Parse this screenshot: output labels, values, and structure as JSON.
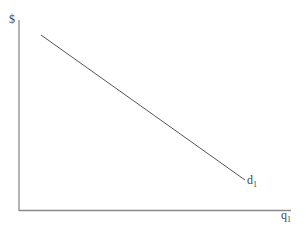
{
  "diagram": {
    "type": "demand-curve",
    "y_axis_label": "$",
    "x_axis_label": "q",
    "x_axis_subscript": "1",
    "curve_label": "d",
    "curve_subscript": "1",
    "curve": {
      "start": [
        41,
        35
      ],
      "end": [
        245,
        180
      ]
    },
    "colors": {
      "axes": "#8a8a8a",
      "curve": "#555555",
      "text": "#444444"
    }
  }
}
